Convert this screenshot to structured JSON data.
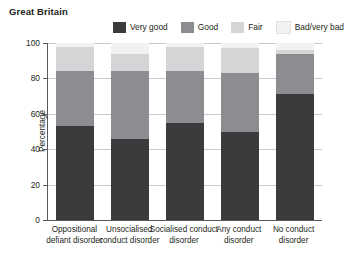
{
  "title": "Great Britain",
  "legend": {
    "position": "top",
    "items": [
      {
        "label": "Very good",
        "color": "#3b3b3d"
      },
      {
        "label": "Good",
        "color": "#8c8d90"
      },
      {
        "label": "Fair",
        "color": "#d4d5d7"
      },
      {
        "label": "Bad/very bad",
        "color": "#f2f2f2"
      }
    ]
  },
  "axes": {
    "ylabel": "Percentage",
    "xlabel": "",
    "yticks": [
      0,
      20,
      40,
      60,
      80,
      100
    ],
    "ylim": [
      0,
      100
    ],
    "grid": true
  },
  "chart_data": {
    "type": "bar",
    "title": "Great Britain",
    "xlabel": "",
    "ylabel": "Percentage",
    "ylim": [
      0,
      100
    ],
    "grid": true,
    "stacked": true,
    "legend_position": "top",
    "categories": [
      "Oppositional defiant disorder",
      "Unsocialised conduct disorder",
      "Socialised conduct disorder",
      "Any conduct disorder",
      "No conduct disorder"
    ],
    "series": [
      {
        "name": "Very good",
        "color": "#3b3b3d",
        "values": [
          53,
          46,
          55,
          50,
          71
        ]
      },
      {
        "name": "Good",
        "color": "#8c8d90",
        "values": [
          31,
          38,
          29,
          33,
          23
        ]
      },
      {
        "name": "Fair",
        "color": "#d4d5d7",
        "values": [
          14,
          10,
          14,
          14,
          2
        ]
      },
      {
        "name": "Bad/very bad",
        "color": "#f2f2f2",
        "values": [
          2,
          6,
          2,
          3,
          4
        ]
      }
    ],
    "totals": [
      100,
      100,
      100,
      100,
      100
    ]
  }
}
